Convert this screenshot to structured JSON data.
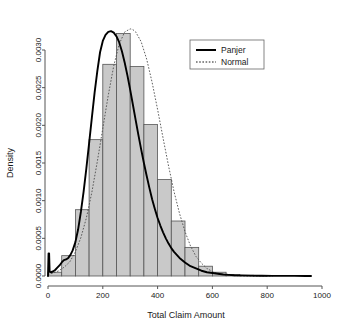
{
  "chart_data": {
    "type": "bar",
    "title": "",
    "subtitle": "",
    "xlabel": "Total Claim Amount",
    "ylabel": "Density",
    "xlim": [
      0,
      1000
    ],
    "ylim": [
      0,
      0.0032
    ],
    "xticks": [
      0,
      200,
      400,
      600,
      800,
      1000
    ],
    "xtick_labels": [
      "0",
      "200",
      "400",
      "600",
      "800",
      "1000"
    ],
    "yticks": [
      0.0,
      0.0005,
      0.001,
      0.0015,
      0.002,
      0.0025,
      0.003
    ],
    "ytick_labels": [
      "0.0000",
      "0.0005",
      "0.0010",
      "0.0015",
      "0.0020",
      "0.0025",
      "0.0030"
    ],
    "grid": false,
    "legend_position": "top-right",
    "bin_width": 50,
    "categories": [
      "0-50",
      "50-100",
      "100-150",
      "150-200",
      "200-250",
      "250-300",
      "300-350",
      "350-400",
      "400-450",
      "450-500",
      "500-550",
      "550-600",
      "600-650",
      "650-700",
      "700-750",
      "750-800"
    ],
    "bin_edges": [
      0,
      50,
      100,
      150,
      200,
      250,
      300,
      350,
      400,
      450,
      500,
      550,
      600,
      650,
      700,
      750,
      800
    ],
    "values": [
      5e-05,
      0.00027,
      0.00088,
      0.00181,
      0.00281,
      0.00322,
      0.00278,
      0.00201,
      0.00128,
      0.00073,
      0.00038,
      0.00013,
      5e-05,
      2e-05,
      1e-05,
      5e-06
    ],
    "histogram_fill": "#c9c9c9",
    "histogram_edge": "#555555",
    "series": [
      {
        "name": "Panjer",
        "style": "solid",
        "color": "#000000",
        "x": [
          0,
          2,
          4,
          6,
          10,
          18,
          26,
          34,
          42,
          50,
          58,
          66,
          74,
          82,
          90,
          100,
          110,
          120,
          130,
          140,
          150,
          160,
          170,
          180,
          190,
          200,
          210,
          220,
          230,
          240,
          250,
          260,
          270,
          280,
          290,
          300,
          310,
          320,
          330,
          340,
          350,
          360,
          370,
          380,
          390,
          400,
          410,
          420,
          430,
          440,
          450,
          460,
          480,
          500,
          520,
          540,
          560,
          580,
          600,
          620,
          640,
          660,
          680,
          700,
          740,
          780,
          820,
          860,
          900,
          940,
          960
        ],
        "y": [
          0.0,
          0.0003,
          0.0003,
          6e-05,
          5e-05,
          6e-05,
          8e-05,
          0.00011,
          0.00014,
          0.00018,
          0.00021,
          0.00022,
          0.00024,
          0.00028,
          0.00034,
          0.00045,
          0.00062,
          0.00085,
          0.00112,
          0.00143,
          0.00176,
          0.0021,
          0.00243,
          0.00272,
          0.00297,
          0.00312,
          0.0032,
          0.00324,
          0.00325,
          0.00323,
          0.00318,
          0.0031,
          0.00298,
          0.00283,
          0.00266,
          0.00247,
          0.00227,
          0.00207,
          0.00187,
          0.00168,
          0.0015,
          0.00133,
          0.00117,
          0.00102,
          0.00089,
          0.00077,
          0.00067,
          0.00058,
          0.0005,
          0.00043,
          0.00037,
          0.00032,
          0.00024,
          0.00018,
          0.00013,
          0.0001,
          7e-05,
          5e-05,
          4e-05,
          3e-05,
          2e-05,
          1.5e-05,
          1e-05,
          8e-06,
          5e-06,
          3e-06,
          2e-06,
          1e-06,
          1e-06,
          0.0,
          0.0
        ]
      },
      {
        "name": "Normal",
        "style": "dotted",
        "color": "#4d4d4d",
        "x": [
          0,
          20,
          40,
          60,
          80,
          100,
          120,
          140,
          160,
          180,
          200,
          220,
          240,
          260,
          280,
          300,
          310,
          320,
          340,
          360,
          380,
          400,
          420,
          440,
          460,
          480,
          500,
          520,
          540,
          560,
          580,
          600,
          620,
          640,
          660,
          680,
          700,
          740,
          780,
          820
        ],
        "y": [
          2e-05,
          4e-05,
          7e-05,
          0.00012,
          0.00019,
          0.00032,
          0.00051,
          0.00077,
          0.00111,
          0.00152,
          0.00196,
          0.0024,
          0.00279,
          0.00308,
          0.00324,
          0.00328,
          0.00327,
          0.00324,
          0.00311,
          0.00288,
          0.00257,
          0.00221,
          0.00183,
          0.00146,
          0.00112,
          0.00083,
          0.00059,
          0.0004,
          0.00026,
          0.00017,
          0.0001,
          6e-05,
          3e-05,
          2e-05,
          1e-05,
          5e-06,
          2e-06,
          0.0,
          0.0,
          0.0
        ]
      }
    ],
    "legend": [
      {
        "label": "Panjer",
        "style": "solid"
      },
      {
        "label": "Normal",
        "style": "dotted"
      }
    ]
  }
}
